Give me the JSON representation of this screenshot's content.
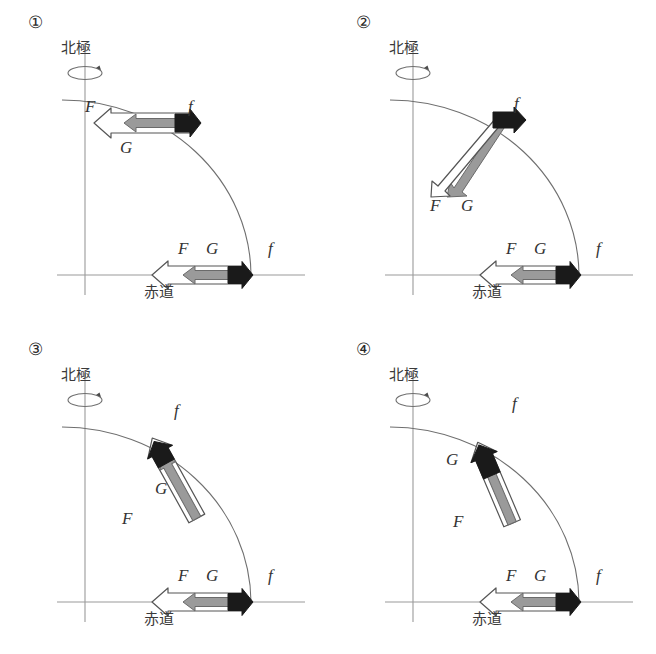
{
  "figure": {
    "kind": "physics-diagram",
    "labels": {
      "north_pole": "北極",
      "equator": "赤道",
      "force_F": "F",
      "force_G": "G",
      "force_f": "f"
    },
    "colors": {
      "ink": "#2b2b2b",
      "axis": "#8f8f8f",
      "arc": "#6f6f6f",
      "arrow_F_fill": "#ffffff",
      "arrow_F_stroke": "#555555",
      "arrow_G_fill": "#9a9a9a",
      "arrow_G_stroke": "#6a6a6a",
      "arrow_f_fill": "#1a1a1a"
    }
  },
  "panels": [
    {
      "id": "panel-1",
      "number": "①",
      "north_pole_label": "北極",
      "equator_label": "赤道",
      "upper": {
        "F": "F",
        "G": "G",
        "f": "f",
        "orientation": "horizontal",
        "note": "F and G point left (toward axis), f points right"
      },
      "lower": {
        "F": "F",
        "G": "G",
        "f": "f",
        "orientation": "horizontal"
      }
    },
    {
      "id": "panel-2",
      "number": "②",
      "north_pole_label": "北極",
      "equator_label": "赤道",
      "upper": {
        "F": "F",
        "G": "G",
        "f": "f",
        "orientation": "splayed-downward",
        "note": "F and G diverge downward from the f arrow tail"
      },
      "lower": {
        "F": "F",
        "G": "G",
        "f": "f",
        "orientation": "horizontal"
      }
    },
    {
      "id": "panel-3",
      "number": "③",
      "north_pole_label": "北極",
      "equator_label": "赤道",
      "upper": {
        "F": "F",
        "G": "G",
        "f": "f",
        "orientation": "diagonal-60deg",
        "note": "F and G point down-left along the radius, f points up-right"
      },
      "lower": {
        "F": "F",
        "G": "G",
        "f": "f",
        "orientation": "horizontal"
      }
    },
    {
      "id": "panel-4",
      "number": "④",
      "north_pole_label": "北極",
      "equator_label": "赤道",
      "upper": {
        "F": "F",
        "G": "G",
        "f": "f",
        "orientation": "diagonal-65deg",
        "note": "Steeper diagonal, longer black f segment extending beyond the arc"
      },
      "lower": {
        "F": "F",
        "G": "G",
        "f": "f",
        "orientation": "horizontal"
      }
    }
  ]
}
